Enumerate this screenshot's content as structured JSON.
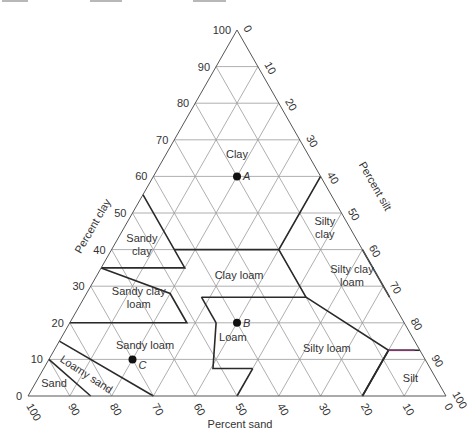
{
  "chart_data": {
    "type": "ternary",
    "axes": {
      "clay": {
        "label": "Percent clay",
        "ticks": [
          "0",
          "10",
          "20",
          "30",
          "40",
          "50",
          "60",
          "70",
          "80",
          "90",
          "100"
        ]
      },
      "silt": {
        "label": "Percent silt",
        "ticks": [
          "0",
          "10",
          "20",
          "30",
          "40",
          "50",
          "60",
          "70",
          "80",
          "90",
          "100"
        ]
      },
      "sand": {
        "label": "Percent sand",
        "ticks": [
          "100",
          "90",
          "80",
          "70",
          "60",
          "50",
          "40",
          "30",
          "20",
          "10",
          "0"
        ]
      }
    },
    "grid": true,
    "regions": [
      {
        "name": "Clay",
        "label_lines": [
          "Clay"
        ],
        "at": {
          "clay": 66,
          "sand": 17
        }
      },
      {
        "name": "Sandy clay",
        "label_lines": [
          "Sandy",
          "clay"
        ],
        "at": {
          "clay": 41.5,
          "sand": 52
        }
      },
      {
        "name": "Silty clay",
        "label_lines": [
          "Silty",
          "clay"
        ],
        "at": {
          "clay": 46,
          "sand": 6
        }
      },
      {
        "name": "Clay loam",
        "label_lines": [
          "Clay loam"
        ],
        "at": {
          "clay": 33,
          "sand": 33
        }
      },
      {
        "name": "Silty clay loam",
        "label_lines": [
          "Silty clay",
          "loam"
        ],
        "at": {
          "clay": 33,
          "sand": 6
        }
      },
      {
        "name": "Sandy clay loam",
        "label_lines": [
          "Sandy clay",
          "loam"
        ],
        "at": {
          "clay": 27,
          "sand": 60
        }
      },
      {
        "name": "Loam",
        "label_lines": [
          "Loam"
        ],
        "at": {
          "clay": 16,
          "sand": 43
        }
      },
      {
        "name": "Sandy loam",
        "label_lines": [
          "Sandy loam"
        ],
        "at": {
          "clay": 14,
          "sand": 65
        }
      },
      {
        "name": "Silty loam",
        "label_lines": [
          "Silty loam"
        ],
        "at": {
          "clay": 13,
          "sand": 22
        }
      },
      {
        "name": "Silt",
        "label_lines": [
          "Silt"
        ],
        "at": {
          "clay": 5,
          "sand": 6
        }
      },
      {
        "name": "Loamy sand",
        "label_lines": [
          "Loamy sand"
        ],
        "at": {
          "clay": 6,
          "sand": 83
        },
        "rotate": 33
      },
      {
        "name": "Sand",
        "label_lines": [
          "Sand"
        ],
        "at": {
          "clay": 3.5,
          "sand": 92
        }
      }
    ],
    "points": [
      {
        "label": "A",
        "clay": 60,
        "sand": 20,
        "silt": 20
      },
      {
        "label": "B",
        "clay": 20,
        "sand": 40,
        "silt": 40
      },
      {
        "label": "C",
        "clay": 10,
        "sand": 70,
        "silt": 20
      }
    ],
    "boundaries": [
      [
        [
          55,
          45
        ],
        [
          35,
          45
        ],
        [
          35,
          65
        ]
      ],
      [
        [
          40,
          45
        ],
        [
          40,
          20
        ],
        [
          60,
          0
        ]
      ],
      [
        [
          40,
          20
        ],
        [
          27,
          20
        ],
        [
          27,
          45
        ]
      ],
      [
        [
          40,
          0
        ],
        [
          27,
          0
        ]
      ],
      [
        [
          35,
          65
        ],
        [
          28,
          52
        ],
        [
          20,
          52
        ],
        [
          20,
          80
        ]
      ],
      [
        [
          27,
          45
        ],
        [
          20,
          45
        ]
      ],
      [
        [
          27,
          20
        ],
        [
          12.5,
          7.5
        ],
        [
          0,
          20
        ]
      ],
      [
        [
          20,
          45
        ],
        [
          7.5,
          52
        ],
        [
          7.5,
          42.5
        ]
      ],
      [
        [
          7.5,
          42.5
        ],
        [
          0,
          50
        ]
      ],
      [
        [
          15,
          85
        ],
        [
          0,
          70
        ]
      ],
      [
        [
          10,
          90
        ],
        [
          0,
          85
        ]
      ],
      [
        [
          12.5,
          7.5
        ],
        [
          12.5,
          0
        ]
      ],
      [
        [
          12.5,
          7.5
        ],
        [
          0,
          20
        ]
      ]
    ],
    "accent_boundaries": [
      [
        [
          12.5,
          7.5
        ],
        [
          12.5,
          0
        ]
      ]
    ]
  }
}
